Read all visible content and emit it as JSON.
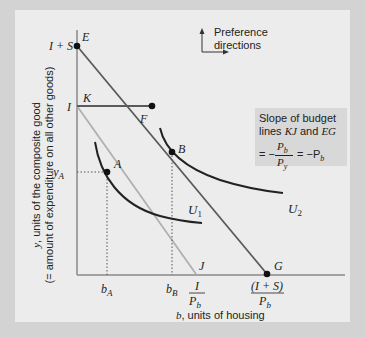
{
  "axes": {
    "y_label_line1": "y, units of the composite good",
    "y_label_line2": "(= amount of expenditure on all other goods)",
    "x_label_var": "b",
    "x_label_text": ", units of housing"
  },
  "points": {
    "E": "E",
    "F": "F",
    "A": "A",
    "B": "B",
    "G": "G",
    "J": "J",
    "K": "K"
  },
  "y_ticks": {
    "I_plus_S": "I + S",
    "I": "I",
    "yA": "y",
    "yA_sub": "A"
  },
  "x_ticks": {
    "bA": "b",
    "bA_sub": "A",
    "bB": "b",
    "bB_sub": "B",
    "I_over_Pb_num": "I",
    "I_over_Pb_den": "P",
    "I_over_Pb_den_sub": "b",
    "IS_over_Pb_num": "(I + S)",
    "IS_over_Pb_den": "P",
    "IS_over_Pb_den_sub": "b"
  },
  "curves": {
    "U1": "U",
    "U1_sub": "1",
    "U2": "U",
    "U2_sub": "2"
  },
  "preference": {
    "line1": "Preference",
    "line2": "directions"
  },
  "slope_box": {
    "line1": "Slope of budget",
    "line2_a": "lines ",
    "line2_b": "KJ",
    "line2_c": " and ",
    "line2_d": "EG",
    "eq_prefix": "= −",
    "frac_num": "P",
    "frac_num_sub": "b",
    "frac_den": "P",
    "frac_den_sub": "y",
    "eq_suffix": "= −P",
    "eq_suffix_sub": "b"
  },
  "colors": {
    "frame": "#d3d3d3",
    "panel": "#ececec",
    "axis": "#888888",
    "budget_KJ": "#b0b0b0",
    "budget_EG": "#555555",
    "curves": "#222222",
    "slope_box": "#d8d8d8"
  }
}
